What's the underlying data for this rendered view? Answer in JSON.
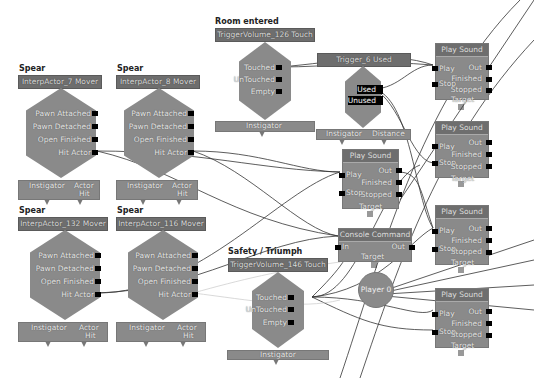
{
  "editor": "Kismet sequence graph",
  "comments": {
    "spear1": "Spear",
    "spear2": "Spear",
    "spear3": "Spear",
    "spear4": "Spear",
    "room_entered": "Room entered",
    "safety": "Safety / Triumph"
  },
  "movers": [
    {
      "title": "InterpActor_7 Mover",
      "ports": [
        "Pawn Attached",
        "Pawn Detached",
        "Open Finished",
        "Hit Actor"
      ],
      "vars": [
        "Instigator",
        "Actor",
        "Hit"
      ]
    },
    {
      "title": "InterpActor_8 Mover",
      "ports": [
        "Pawn Attached",
        "Pawn Detached",
        "Open Finished",
        "Hit Actor"
      ],
      "vars": [
        "Instigator",
        "Actor",
        "Hit"
      ]
    },
    {
      "title": "InterpActor_132 Mover",
      "ports": [
        "Pawn Attached",
        "Pawn Detached",
        "Open Finished",
        "Hit Actor"
      ],
      "vars": [
        "Instigator",
        "Actor",
        "Hit"
      ]
    },
    {
      "title": "InterpActor_116 Mover",
      "ports": [
        "Pawn Attached",
        "Pawn Detached",
        "Open Finished",
        "Hit Actor"
      ],
      "vars": [
        "Instigator",
        "Actor",
        "Hit"
      ]
    }
  ],
  "touch_events": [
    {
      "title": "TriggerVolume_126 Touch",
      "ports": [
        "Touched",
        "UnTouched",
        "Empty"
      ],
      "vars": [
        "Instigator"
      ]
    },
    {
      "title": "TriggerVolume_146 Touch",
      "ports": [
        "Touched",
        "UnTouched",
        "Empty"
      ],
      "vars": [
        "Instigator"
      ]
    }
  ],
  "used_event": {
    "title": "Trigger_6 Used",
    "ports": [
      "Used",
      "Unused"
    ],
    "vars": [
      "Instigator",
      "Distance"
    ]
  },
  "play_sounds": [
    {
      "title": "Play Sound",
      "inputs": [
        "Play",
        "Stop"
      ],
      "outputs": [
        "Out",
        "Finished",
        "Stopped"
      ],
      "target": "Target"
    },
    {
      "title": "Play Sound",
      "inputs": [
        "Play",
        "Stop"
      ],
      "outputs": [
        "Out",
        "Finished",
        "Stopped"
      ],
      "target": "Target"
    },
    {
      "title": "Play Sound",
      "inputs": [
        "Play",
        "Stop"
      ],
      "outputs": [
        "Out",
        "Finished",
        "Stopped"
      ],
      "target": "Target"
    },
    {
      "title": "Play Sound",
      "inputs": [
        "Play",
        "Stop"
      ],
      "outputs": [
        "Out",
        "Finished",
        "Stopped"
      ],
      "target": "Target"
    },
    {
      "title": "Play Sound",
      "inputs": [
        "Play",
        "Stop"
      ],
      "outputs": [
        "Out",
        "Finished",
        "Stopped"
      ],
      "target": "Target"
    }
  ],
  "console_command": {
    "title": "Console Command",
    "input": "In",
    "output": "Out",
    "target": "Target"
  },
  "player_var": {
    "label": "Player 0"
  }
}
